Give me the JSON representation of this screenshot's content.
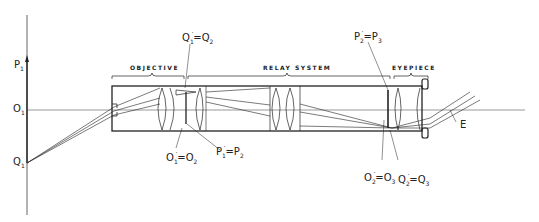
{
  "sections": {
    "objective": "OBJECTIVE",
    "relay_system": "RELAY SYSTEM",
    "eyepiece": "EYEPIECE"
  },
  "labels": {
    "p1": {
      "main": "P",
      "sub": "1"
    },
    "o1_axis": {
      "main": "O",
      "sub": "1"
    },
    "q1_object": {
      "main": "Q",
      "sub": "1"
    },
    "q1p_eq_q2": {
      "left": "Q",
      "left_sub": "1",
      "right": "Q",
      "right_sub": "2",
      "eq": "="
    },
    "o1_eq_o2": {
      "left": "O",
      "left_sub": "1",
      "right": "O",
      "right_sub": "2",
      "eq": "="
    },
    "p1p_eq_p2": {
      "left": "P",
      "left_sub": "1",
      "right": "P",
      "right_sub": "2",
      "eq": "="
    },
    "p2p_eq_p3": {
      "left": "P",
      "left_sub": "2",
      "right": "P",
      "right_sub": "3",
      "eq": "="
    },
    "o2p_eq_o3": {
      "left": "O",
      "left_sub": "2",
      "right": "O",
      "right_sub": "3",
      "eq": "="
    },
    "q2p_eq_q3": {
      "left": "Q",
      "left_sub": "2",
      "right": "Q",
      "right_sub": "3",
      "eq": "="
    },
    "exit_pupil": "E"
  },
  "prime_mark": "′",
  "colors": {
    "ink": "#222222",
    "background": "#ffffff",
    "thin_line": "#555555"
  }
}
